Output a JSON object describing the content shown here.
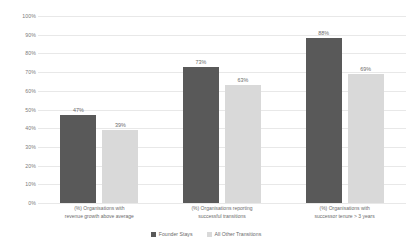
{
  "chart_data": {
    "type": "bar",
    "title": "",
    "subtitle": "",
    "xlabel": "",
    "ylabel": "",
    "ylim": [
      0,
      100
    ],
    "grid": true,
    "legend_position": "bottom-center",
    "y_ticks": [
      "0%",
      "10%",
      "20%",
      "30%",
      "40%",
      "50%",
      "60%",
      "70%",
      "80%",
      "90%",
      "100%"
    ],
    "y_tick_values": [
      0,
      10,
      20,
      30,
      40,
      50,
      60,
      70,
      80,
      90,
      100
    ],
    "categories": [
      "(%) Organisations with revenue growth above average",
      "(%) Organisations reporting successful transitions",
      "(%) Organisations with successor tenure > 3 years"
    ],
    "category_lines": [
      [
        "(%) Organisations with",
        "revenue growth above average"
      ],
      [
        "(%) Organisations reporting",
        "successful transitions"
      ],
      [
        "(%) Organisations with",
        "successor tenure > 3 years"
      ]
    ],
    "series": [
      {
        "name": "Founder Stays",
        "color": "#595959",
        "values": [
          47,
          73,
          88
        ],
        "labels": [
          "47%",
          "73%",
          "88%"
        ]
      },
      {
        "name": "All Other Transitions",
        "color": "#d9d9d9",
        "values": [
          39,
          63,
          69
        ],
        "labels": [
          "39%",
          "63%",
          "69%"
        ]
      }
    ]
  },
  "colors": {
    "background": "#ffffff",
    "gridline": "#e8e8e8",
    "text": "#6b6b6b",
    "series_founder_stays": "#595959",
    "series_all_other_transitions": "#d9d9d9"
  }
}
